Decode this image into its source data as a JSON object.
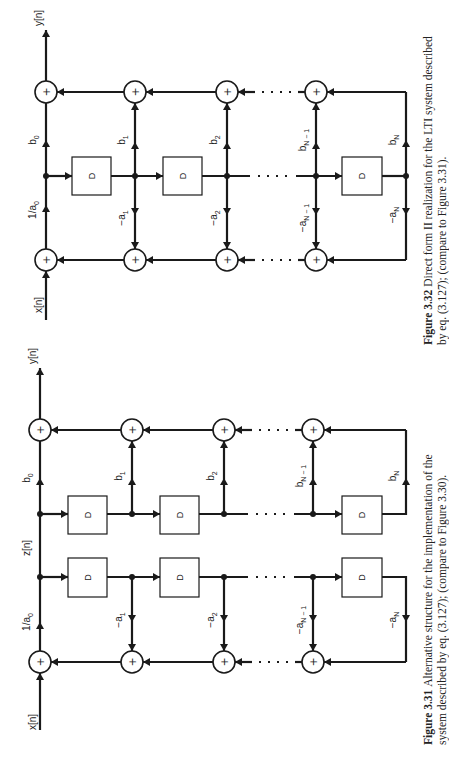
{
  "figures": [
    {
      "id": "fig-3-32",
      "type": "direct-form-II",
      "caption_number": "Figure 3.32",
      "caption_lines": [
        "Direct form II realization for the LTI system described",
        "by eq. (3.127); (compare to Figure 3.31)."
      ],
      "input_label": "x[n]",
      "output_label": "y[n]",
      "gain_label": "1/a0",
      "gain_sub": [
        "1/a",
        "0"
      ],
      "delay_label": "D",
      "feedforward_labels": [
        [
          "b",
          "0"
        ],
        [
          "b",
          "1"
        ],
        [
          "b",
          "2"
        ],
        [
          "b",
          "N − 1"
        ],
        [
          "b",
          "N"
        ]
      ],
      "feedback_labels": [
        [
          "−a",
          "1"
        ],
        [
          "−a",
          "2"
        ],
        [
          "−a",
          "N − 1"
        ],
        [
          "−a",
          "N"
        ]
      ],
      "adder_symbol": "+"
    },
    {
      "id": "fig-3-31",
      "type": "alternative-structure",
      "caption_number": "Figure 3.31",
      "caption_lines": [
        "Alternative structure for the implementation of the",
        "system described by eq. (3.127); (compare to Figure 3.30)."
      ],
      "input_label": "x[n]",
      "output_label": "y[n]",
      "intermediate_label": "z[n]",
      "gain_sub": [
        "1/a",
        "0"
      ],
      "delay_label": "D",
      "feedforward_labels": [
        [
          "b",
          "0"
        ],
        [
          "b",
          "1"
        ],
        [
          "b",
          "2"
        ],
        [
          "b",
          "N − 1"
        ],
        [
          "b",
          "N"
        ]
      ],
      "feedback_labels": [
        [
          "−a",
          "1"
        ],
        [
          "−a",
          "2"
        ],
        [
          "−a",
          "N − 1"
        ],
        [
          "−a",
          "N"
        ]
      ],
      "adder_symbol": "+"
    }
  ]
}
